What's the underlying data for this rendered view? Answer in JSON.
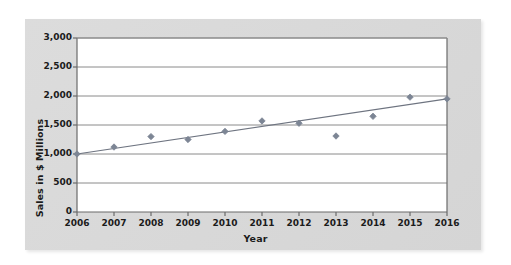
{
  "chart_data": {
    "type": "scatter",
    "title": "",
    "xlabel": "Year",
    "ylabel": "Sales in $ Millions",
    "x": [
      2006,
      2007,
      2008,
      2009,
      2010,
      2011,
      2012,
      2013,
      2014,
      2015,
      2016
    ],
    "values": [
      1000,
      1120,
      1300,
      1250,
      1390,
      1570,
      1530,
      1310,
      1650,
      1980,
      1950
    ],
    "categories": [
      "2006",
      "2007",
      "2008",
      "2009",
      "2010",
      "2011",
      "2012",
      "2013",
      "2014",
      "2015",
      "2016"
    ],
    "xtick_labels": [
      "2006",
      "2007",
      "2008",
      "2009",
      "2010",
      "2011",
      "2012",
      "2013",
      "2014",
      "2015",
      "2016"
    ],
    "ytick_labels": [
      "0",
      "500",
      "1,000",
      "1,500",
      "2,000",
      "2,500",
      "3,000"
    ],
    "ytick_values": [
      0,
      500,
      1000,
      1500,
      2000,
      2500,
      3000
    ],
    "ylim": [
      0,
      3000
    ],
    "xlim": [
      2006,
      2016
    ],
    "grid": "horizontal",
    "legend": "none",
    "series": [
      {
        "name": "Sales",
        "type": "scatter",
        "marker": "diamond",
        "color": "#7c8594",
        "values": [
          1000,
          1120,
          1300,
          1250,
          1390,
          1570,
          1530,
          1310,
          1650,
          1980,
          1950
        ]
      },
      {
        "name": "Trend line",
        "type": "line",
        "color": "#6e7480",
        "x": [
          2006,
          2016
        ],
        "values": [
          1000,
          1950
        ]
      }
    ],
    "annotations": []
  },
  "style": {
    "panel_bg": "#d8d8d8",
    "plot_bg": "#ffffff",
    "grid_color": "#8a8a8a",
    "axis_color": "#6b6b6b",
    "marker_color": "#7c8594",
    "line_color": "#6e7480",
    "text_color": "#1b1b1b"
  }
}
